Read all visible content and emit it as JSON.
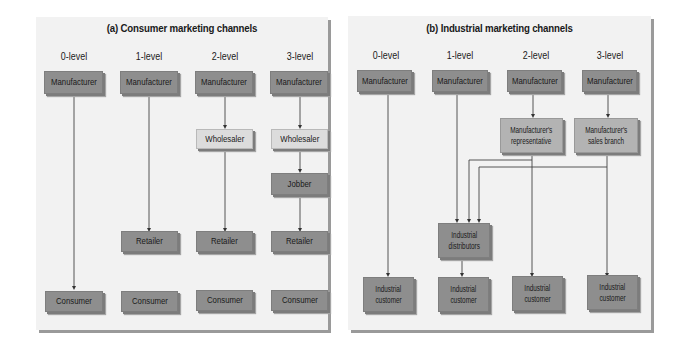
{
  "consumer": {
    "title": "(a) Consumer marketing channels",
    "levels": [
      "0-level",
      "1-level",
      "2-level",
      "3-level"
    ],
    "channels": [
      [
        "Manufacturer",
        "Consumer"
      ],
      [
        "Manufacturer",
        "Retailer",
        "Consumer"
      ],
      [
        "Manufacturer",
        "Wholesaler",
        "Retailer",
        "Consumer"
      ],
      [
        "Manufacturer",
        "Wholesaler",
        "Jobber",
        "Retailer",
        "Consumer"
      ]
    ],
    "labels": {
      "manufacturer": "Manufacturer",
      "wholesaler": "Wholesaler",
      "jobber": "Jobber",
      "retailer": "Retailer",
      "consumer": "Consumer"
    }
  },
  "industrial": {
    "title": "(b) Industrial marketing channels",
    "levels": [
      "0-level",
      "1-level",
      "2-level",
      "3-level"
    ],
    "channels": [
      [
        "Manufacturer",
        "Industrial customer"
      ],
      [
        "Manufacturer",
        "Industrial distributors",
        "Industrial customer"
      ],
      [
        "Manufacturer",
        "Manufacturer's representative",
        "Industrial distributors / Industrial customer"
      ],
      [
        "Manufacturer",
        "Manufacturer's sales branch",
        "Industrial distributors / Industrial customer"
      ]
    ],
    "labels": {
      "manufacturer": "Manufacturer",
      "rep_line1": "Manufacturer's",
      "rep_line2": "representative",
      "branch_line1": "Manufacturer's",
      "branch_line2": "sales branch",
      "dist_line1": "Industrial",
      "dist_line2": "distributors",
      "cust_line1": "Industrial",
      "cust_line2": "customer"
    }
  },
  "colors": {
    "panel_bg": "#f2f2f2",
    "dark_box": "#8e8e8e",
    "light_box": "#dcdcdc",
    "mid_box": "#b3b3b3",
    "line": "#333333"
  }
}
